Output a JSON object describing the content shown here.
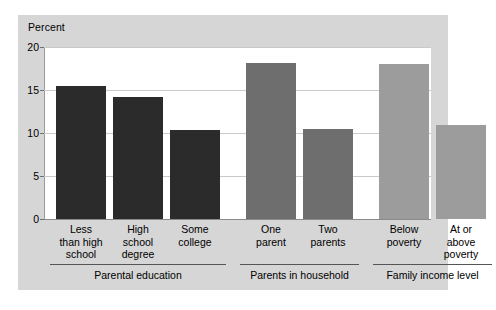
{
  "chart_data": {
    "type": "bar",
    "title": "",
    "subtitle": "",
    "xlabel": "",
    "ylabel": "Percent",
    "ylim": [
      0,
      20
    ],
    "yticks": [
      0,
      5,
      10,
      15,
      20
    ],
    "ytick_labels": [
      "0",
      "5",
      "10",
      "15",
      "20"
    ],
    "grid": true,
    "legend": "none",
    "categories": [
      "Less\nthan high\nschool",
      "High\nschool\ndegree",
      "Some\ncollege",
      "One\nparent",
      "Two\nparents",
      "Below\npoverty",
      "At or\nabove\npoverty"
    ],
    "values": [
      15.5,
      14.2,
      10.3,
      18.1,
      10.5,
      18.0,
      10.9
    ],
    "bar_colors": [
      "#2b2b2b",
      "#2b2b2b",
      "#2b2b2b",
      "#6e6e6e",
      "#6e6e6e",
      "#9c9c9c",
      "#9c9c9c"
    ],
    "groups": [
      {
        "label": "Parental education",
        "bar_indices": [
          0,
          1,
          2
        ]
      },
      {
        "label": "Parents in household",
        "bar_indices": [
          3,
          4
        ]
      },
      {
        "label": "Family income level",
        "bar_indices": [
          5,
          6
        ]
      }
    ]
  },
  "figure": {
    "background_color": "#d6d6d6",
    "plot_background_color": "#ffffff",
    "gridline_color": "#c9c9c9"
  }
}
